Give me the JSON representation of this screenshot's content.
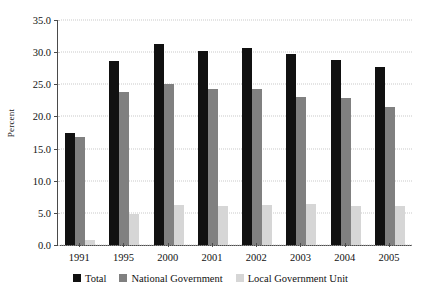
{
  "chart_data": {
    "type": "bar",
    "title": "",
    "xlabel": "",
    "ylabel": "Percent",
    "ylim": [
      0,
      35
    ],
    "ytick_step": 5,
    "yticks": [
      "0.0",
      "5.0",
      "10.0",
      "15.0",
      "20.0",
      "25.0",
      "30.0",
      "35.0"
    ],
    "grid": true,
    "legend_position": "bottom",
    "categories": [
      "1991",
      "1995",
      "2000",
      "2001",
      "2002",
      "2003",
      "2004",
      "2005"
    ],
    "series": [
      {
        "name": "Total",
        "color": "#111111",
        "values": [
          17.5,
          28.7,
          31.2,
          30.2,
          30.7,
          29.7,
          28.8,
          27.7
        ]
      },
      {
        "name": "National Government",
        "color": "#808080",
        "values": [
          16.8,
          23.8,
          25.0,
          24.2,
          24.2,
          23.1,
          22.8,
          21.5
        ]
      },
      {
        "name": "Local Government Unit",
        "color": "#d6d6d6",
        "values": [
          0.8,
          4.9,
          6.2,
          6.1,
          6.3,
          6.4,
          6.0,
          6.1
        ]
      }
    ]
  },
  "colors": {
    "total": "#111111",
    "national_government": "#808080",
    "local_government_unit": "#d6d6d6",
    "axis": "#4a4a4a",
    "gridline": "#c9c9c9",
    "background": "#ffffff"
  }
}
